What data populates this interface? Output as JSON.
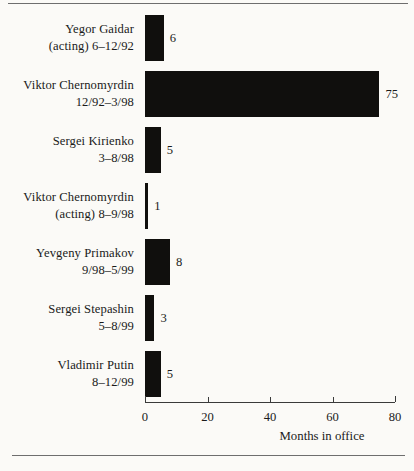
{
  "chart_data": {
    "type": "bar",
    "orientation": "horizontal",
    "title": "",
    "xlabel": "Months in office",
    "ylabel": "",
    "xlim": [
      0,
      80
    ],
    "xticks": [
      0,
      20,
      40,
      60,
      80
    ],
    "xticklabels": [
      "0",
      "20",
      "40",
      "60",
      "80"
    ],
    "grid": false,
    "legend": null,
    "bar_color": "#100f0d",
    "background_color": "#fbfaf7",
    "categories": [
      "Yegor Gaidar (acting) 6–12/92",
      "Viktor Chernomyrdin 12/92–3/98",
      "Sergei Kirienko 3–8/98",
      "Viktor Chernomyrdin (acting) 8–9/98",
      "Yevgeny Primakov 9/98–5/99",
      "Sergei Stepashin 5–8/99",
      "Vladimir Putin 8–12/99"
    ],
    "values": [
      6,
      75,
      5,
      1,
      8,
      3,
      5
    ],
    "bars": [
      {
        "name": "Yegor Gaidar",
        "label_line1": "Yegor Gaidar",
        "label_line2": "(acting) 6–12/92",
        "value": 6,
        "value_label": "6"
      },
      {
        "name": "Viktor Chernomyrdin",
        "label_line1": "Viktor Chernomyrdin",
        "label_line2": "12/92–3/98",
        "value": 75,
        "value_label": "75"
      },
      {
        "name": "Sergei Kirienko",
        "label_line1": "Sergei Kirienko",
        "label_line2": "3–8/98",
        "value": 5,
        "value_label": "5"
      },
      {
        "name": "Viktor Chernomyrdin (acting)",
        "label_line1": "Viktor Chernomyrdin",
        "label_line2": "(acting) 8–9/98",
        "value": 1,
        "value_label": "1"
      },
      {
        "name": "Yevgeny Primakov",
        "label_line1": "Yevgeny Primakov",
        "label_line2": "9/98–5/99",
        "value": 8,
        "value_label": "8"
      },
      {
        "name": "Sergei Stepashin",
        "label_line1": "Sergei Stepashin",
        "label_line2": "5–8/99",
        "value": 3,
        "value_label": "3"
      },
      {
        "name": "Vladimir Putin",
        "label_line1": "Vladimir Putin",
        "label_line2": "8–12/99",
        "value": 5,
        "value_label": "5"
      }
    ]
  }
}
